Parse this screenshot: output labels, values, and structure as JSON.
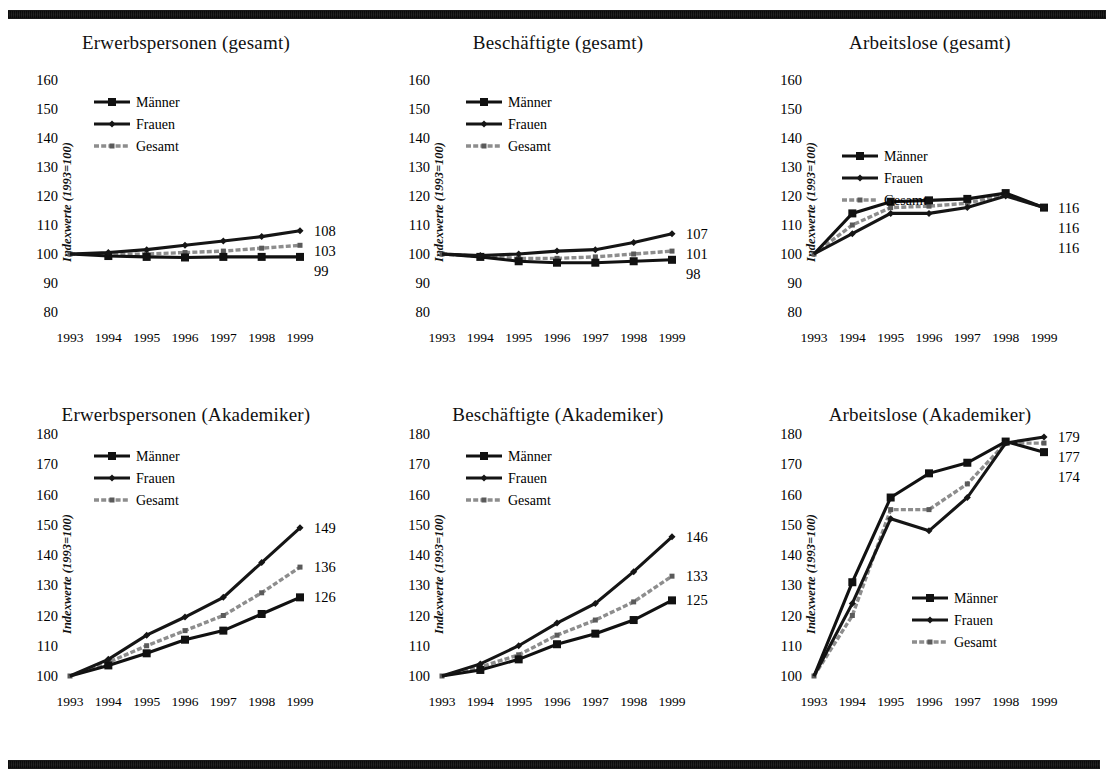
{
  "figure": {
    "ylabel": "Indexwerte (1993=100)",
    "years": [
      "1993",
      "1994",
      "1995",
      "1996",
      "1997",
      "1998",
      "1999"
    ],
    "legend": {
      "men": "Männer",
      "women": "Frauen",
      "total": "Gesamt"
    },
    "colors": {
      "men": "#111111",
      "women": "#151515",
      "total": "#8d8d8d",
      "rule": "#3a3a3a",
      "background": "#ffffff"
    }
  },
  "chart_data": [
    {
      "id": "erwerbspersonen-gesamt",
      "type": "line",
      "title": "Erwerbspersonen (gesamt)",
      "xlabel": "",
      "ylabel": "Indexwerte (1993=100)",
      "x": [
        "1993",
        "1994",
        "1995",
        "1996",
        "1997",
        "1998",
        "1999"
      ],
      "yticks": [
        80,
        90,
        100,
        110,
        120,
        130,
        140,
        150,
        160
      ],
      "ylim": [
        80,
        160
      ],
      "grid": false,
      "legend_position": "top-left",
      "series": [
        {
          "name": "Männer",
          "values": [
            100,
            99.3,
            99,
            98.8,
            99,
            99,
            99
          ],
          "end_label": "99"
        },
        {
          "name": "Frauen",
          "values": [
            100,
            100.5,
            101.5,
            103,
            104.5,
            106,
            108
          ],
          "end_label": "108"
        },
        {
          "name": "Gesamt",
          "values": [
            100,
            99.8,
            100,
            100.5,
            101,
            102,
            103
          ],
          "end_label": "103"
        }
      ]
    },
    {
      "id": "beschaeftigte-gesamt",
      "type": "line",
      "title": "Beschäftigte (gesamt)",
      "xlabel": "",
      "ylabel": "Indexwerte (1993=100)",
      "x": [
        "1993",
        "1994",
        "1995",
        "1996",
        "1997",
        "1998",
        "1999"
      ],
      "yticks": [
        80,
        90,
        100,
        110,
        120,
        130,
        140,
        150,
        160
      ],
      "ylim": [
        80,
        160
      ],
      "grid": false,
      "legend_position": "top-left",
      "series": [
        {
          "name": "Männer",
          "values": [
            100,
            99,
            97.5,
            97,
            97,
            97.5,
            98
          ],
          "end_label": "98"
        },
        {
          "name": "Frauen",
          "values": [
            100,
            99.5,
            100,
            101,
            101.5,
            104,
            107
          ],
          "end_label": "107"
        },
        {
          "name": "Gesamt",
          "values": [
            100,
            99.2,
            98.5,
            98.5,
            99,
            100,
            101
          ],
          "end_label": "101"
        }
      ]
    },
    {
      "id": "arbeitslose-gesamt",
      "type": "line",
      "title": "Arbeitslose (gesamt)",
      "xlabel": "",
      "ylabel": "Indexwerte (1993=100)",
      "x": [
        "1993",
        "1994",
        "1995",
        "1996",
        "1997",
        "1998",
        "1999"
      ],
      "yticks": [
        80,
        90,
        100,
        110,
        120,
        130,
        140,
        150,
        160
      ],
      "ylim": [
        80,
        160
      ],
      "grid": false,
      "legend_position": "middle-left",
      "series": [
        {
          "name": "Männer",
          "values": [
            100,
            114,
            118,
            118.5,
            119,
            121,
            116
          ],
          "end_label": "116"
        },
        {
          "name": "Frauen",
          "values": [
            100,
            107,
            114,
            114,
            116,
            120,
            116
          ],
          "end_label": "116"
        },
        {
          "name": "Gesamt",
          "values": [
            100,
            110,
            116,
            116.5,
            117.5,
            120.5,
            116
          ],
          "end_label": "116"
        }
      ]
    },
    {
      "id": "erwerbspersonen-akademiker",
      "type": "line",
      "title": "Erwerbspersonen (Akademiker)",
      "xlabel": "",
      "ylabel": "Indexwerte (1993=100)",
      "x": [
        "1993",
        "1994",
        "1995",
        "1996",
        "1997",
        "1998",
        "1999"
      ],
      "yticks": [
        100,
        110,
        120,
        130,
        140,
        150,
        160,
        170,
        180
      ],
      "ylim": [
        100,
        180
      ],
      "grid": false,
      "legend_position": "top-left",
      "series": [
        {
          "name": "Männer",
          "values": [
            100,
            103.5,
            107.5,
            112,
            115,
            120.5,
            126
          ],
          "end_label": "126"
        },
        {
          "name": "Frauen",
          "values": [
            100,
            105.5,
            113.5,
            119.5,
            126,
            137.5,
            149
          ],
          "end_label": "149"
        },
        {
          "name": "Gesamt",
          "values": [
            100,
            104.5,
            110,
            115,
            120,
            127.5,
            136
          ],
          "end_label": "136"
        }
      ]
    },
    {
      "id": "beschaeftigte-akademiker",
      "type": "line",
      "title": "Beschäftigte (Akademiker)",
      "xlabel": "",
      "ylabel": "Indexwerte (1993=100)",
      "x": [
        "1993",
        "1994",
        "1995",
        "1996",
        "1997",
        "1998",
        "1999"
      ],
      "yticks": [
        100,
        110,
        120,
        130,
        140,
        150,
        160,
        170,
        180
      ],
      "ylim": [
        100,
        180
      ],
      "grid": false,
      "legend_position": "top-left",
      "series": [
        {
          "name": "Männer",
          "values": [
            100,
            102,
            105.5,
            110.5,
            114,
            118.5,
            125
          ],
          "end_label": "125"
        },
        {
          "name": "Frauen",
          "values": [
            100,
            104,
            110,
            117.5,
            124,
            134.5,
            146
          ],
          "end_label": "146"
        },
        {
          "name": "Gesamt",
          "values": [
            100,
            103,
            107,
            113.5,
            118.5,
            124.5,
            133
          ],
          "end_label": "133"
        }
      ]
    },
    {
      "id": "arbeitslose-akademiker",
      "type": "line",
      "title": "Arbeitslose (Akademiker)",
      "xlabel": "",
      "ylabel": "Indexwerte (1993=100)",
      "x": [
        "1993",
        "1994",
        "1995",
        "1996",
        "1997",
        "1998",
        "1999"
      ],
      "yticks": [
        100,
        110,
        120,
        130,
        140,
        150,
        160,
        170,
        180
      ],
      "ylim": [
        100,
        180
      ],
      "grid": false,
      "legend_position": "bottom-right",
      "series": [
        {
          "name": "Männer",
          "values": [
            100,
            131,
            159,
            167,
            170.5,
            177.5,
            174
          ],
          "end_label": "174"
        },
        {
          "name": "Frauen",
          "values": [
            100,
            124,
            152,
            148,
            159,
            177,
            179
          ],
          "end_label": "179"
        },
        {
          "name": "Gesamt",
          "values": [
            100,
            120,
            155,
            155,
            163.5,
            177,
            177
          ],
          "end_label": "177"
        }
      ]
    }
  ]
}
